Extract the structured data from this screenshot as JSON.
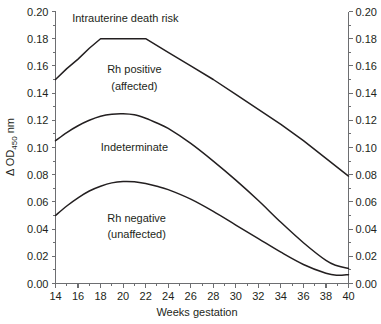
{
  "chart_data": {
    "type": "line",
    "title": "",
    "xlabel": "Weeks gestation",
    "ylabel": "Δ OD450 nm",
    "ylabel_base": "Δ OD",
    "ylabel_sub": "450",
    "ylabel_tail": " nm",
    "xlim": [
      14,
      40
    ],
    "ylim": [
      0.0,
      0.2
    ],
    "grid": false,
    "legend": "none",
    "x_ticks": [
      14,
      16,
      18,
      20,
      22,
      24,
      26,
      28,
      30,
      32,
      34,
      36,
      38,
      40
    ],
    "x_tick_labels": [
      "14",
      "16",
      "18",
      "20",
      "22",
      "24",
      "26",
      "28",
      "30",
      "32",
      "34",
      "36",
      "38",
      "40"
    ],
    "x_minor_ticks": [
      15,
      17,
      19,
      21,
      23,
      25,
      27,
      29,
      31,
      33,
      35,
      37,
      39
    ],
    "y_ticks": [
      0.0,
      0.02,
      0.04,
      0.06,
      0.08,
      0.1,
      0.12,
      0.14,
      0.16,
      0.18,
      0.2
    ],
    "y_tick_labels_left": [
      "0.00",
      "0.02",
      "0.04",
      "0.06",
      "0.08",
      "0.10",
      "0.12",
      "0.14",
      "0.16",
      "0.18",
      "0.20"
    ],
    "y_tick_labels_right": [
      "0.00",
      "0.02",
      "0.04",
      "0.06",
      "0.08",
      "0.10",
      "0.12",
      "0.14",
      "0.16",
      "0.18",
      "0.20"
    ],
    "y_minor_ticks": [
      0.01,
      0.03,
      0.05,
      0.07,
      0.09,
      0.11,
      0.13,
      0.15,
      0.17,
      0.19
    ],
    "series": [
      {
        "name": "upper-boundary",
        "x": [
          14,
          15,
          16,
          17,
          18,
          19,
          20,
          21,
          22,
          24,
          26,
          28,
          30,
          32,
          34,
          36,
          38,
          40
        ],
        "values": [
          0.15,
          0.158,
          0.165,
          0.173,
          0.18,
          0.18,
          0.18,
          0.18,
          0.18,
          0.17,
          0.16,
          0.15,
          0.139,
          0.128,
          0.117,
          0.105,
          0.092,
          0.079
        ]
      },
      {
        "name": "middle-boundary",
        "x": [
          14,
          15,
          16,
          17,
          18,
          19,
          20,
          21,
          22,
          23,
          24,
          26,
          28,
          30,
          32,
          34,
          36,
          38,
          39,
          40
        ],
        "values": [
          0.105,
          0.111,
          0.116,
          0.12,
          0.123,
          0.1245,
          0.1248,
          0.124,
          0.1215,
          0.118,
          0.114,
          0.103,
          0.09,
          0.076,
          0.061,
          0.045,
          0.03,
          0.017,
          0.013,
          0.011
        ]
      },
      {
        "name": "lower-boundary",
        "x": [
          14,
          15,
          16,
          17,
          18,
          19,
          20,
          21,
          22,
          23,
          24,
          26,
          28,
          30,
          32,
          34,
          36,
          38,
          39,
          40
        ],
        "values": [
          0.05,
          0.057,
          0.063,
          0.068,
          0.0715,
          0.074,
          0.075,
          0.0748,
          0.0735,
          0.0715,
          0.069,
          0.062,
          0.053,
          0.043,
          0.033,
          0.023,
          0.014,
          0.0075,
          0.006,
          0.0065
        ]
      }
    ],
    "annotations": [
      {
        "id": "zone-intrauterine-death",
        "text": "Intrauterine death risk",
        "x": 20.2,
        "y": 0.192
      },
      {
        "id": "zone-rh-positive-line1",
        "text": "Rh positive",
        "x": 21.0,
        "y": 0.1545
      },
      {
        "id": "zone-rh-positive-line2",
        "text": "(affected)",
        "x": 21.0,
        "y": 0.1425
      },
      {
        "id": "zone-indeterminate",
        "text": "Indeterminate",
        "x": 21.0,
        "y": 0.0975
      },
      {
        "id": "zone-rh-negative-line1",
        "text": "Rh negative",
        "x": 21.2,
        "y": 0.0455
      },
      {
        "id": "zone-rh-negative-line2",
        "text": "(unaffected)",
        "x": 21.2,
        "y": 0.0335
      }
    ],
    "colors": {
      "curve": "#231f20",
      "axis": "#6d6e71",
      "text": "#231f20",
      "background": "#ffffff"
    }
  }
}
